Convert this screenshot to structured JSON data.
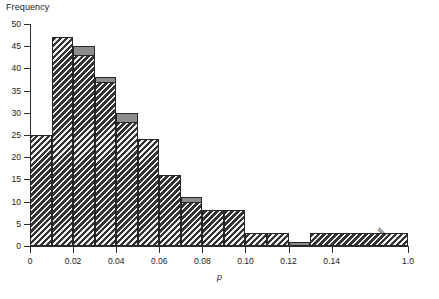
{
  "axes": {
    "ylabel": "Frequency",
    "xlabel": "p",
    "yticks": [
      "0",
      "5",
      "10",
      "15",
      "20",
      "25",
      "30",
      "35",
      "40",
      "45",
      "50"
    ],
    "xticks": [
      "0",
      "0.02",
      "0.04",
      "0.06",
      "0.08",
      "0.10",
      "0.12",
      "0.14",
      "1.0"
    ],
    "break_marker": "//"
  },
  "chart_data": {
    "type": "bar",
    "title": "",
    "xlabel": "p",
    "ylabel": "Frequency",
    "ylim": [
      0,
      50
    ],
    "xlim": [
      0,
      1.0
    ],
    "grid": false,
    "legend": "none",
    "axis_break": {
      "from": 0.15,
      "to": 0.97,
      "marker": "//"
    },
    "bin_edges": [
      0,
      0.01,
      0.02,
      0.03,
      0.04,
      0.05,
      0.06,
      0.07,
      0.08,
      0.09,
      0.1,
      0.11,
      0.12,
      0.13,
      1.0
    ],
    "categories": [
      "0-0.01",
      "0.01-0.02",
      "0.02-0.03",
      "0.03-0.04",
      "0.04-0.05",
      "0.05-0.06",
      "0.06-0.07",
      "0.07-0.08",
      "0.08-0.09",
      "0.09-0.10",
      "0.10-0.11",
      "0.11-0.12",
      "0.12-0.13",
      "0.13-1.0"
    ],
    "series": [
      {
        "name": "gray",
        "style": "solid-gray",
        "color": "#8c8c8c",
        "values": [
          25,
          45,
          45,
          38,
          30,
          23,
          16,
          11,
          8,
          8,
          3,
          3,
          1,
          2
        ]
      },
      {
        "name": "hatched",
        "style": "diagonal-hatch",
        "color": "#3a3a3a",
        "values": [
          25,
          47,
          43,
          37,
          28,
          24,
          16,
          10,
          8,
          8,
          3,
          3,
          0,
          3
        ]
      }
    ]
  }
}
